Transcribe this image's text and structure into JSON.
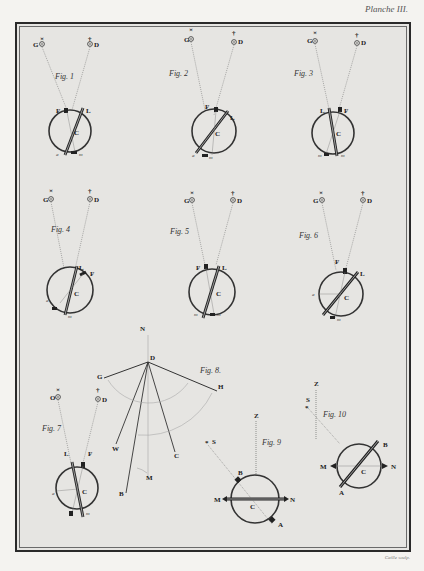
{
  "plate": {
    "title": "Planche III.",
    "engraver": "Caille sculp."
  },
  "figures": [
    {
      "id": "fig1",
      "label": "Fig. 1",
      "left_star": "G",
      "right_star": "D",
      "left_symbol": "×",
      "right_symbol": "†",
      "sight_left": "F",
      "sight_right": "L",
      "center": "C",
      "lower_left": "a",
      "lower_right": "m"
    },
    {
      "id": "fig2",
      "label": "Fig. 2",
      "left_star": "G",
      "right_star": "D",
      "left_symbol": "×",
      "right_symbol": "†",
      "sight_left": "F",
      "sight_right": "L",
      "center": "C",
      "lower_left": "a",
      "lower_right": "m"
    },
    {
      "id": "fig3",
      "label": "Fig. 3",
      "left_star": "G",
      "right_star": "D",
      "left_symbol": "×",
      "right_symbol": "†",
      "sight_left": "L",
      "sight_right": "F",
      "center": "C",
      "lower_left": "m",
      "lower_right": "m"
    },
    {
      "id": "fig4",
      "label": "Fig. 4",
      "left_star": "G",
      "right_star": "D",
      "left_symbol": "×",
      "right_symbol": "†",
      "sight_left": "L",
      "sight_right": "F",
      "center": "C",
      "lower_left": "a",
      "lower_right": "m"
    },
    {
      "id": "fig5",
      "label": "Fig. 5",
      "left_star": "G",
      "right_star": "D",
      "left_symbol": "×",
      "right_symbol": "†",
      "sight_left": "F",
      "sight_right": "L",
      "center": "C",
      "lower_left": "m",
      "lower_right": "m"
    },
    {
      "id": "fig6",
      "label": "Fig. 6",
      "left_star": "G",
      "right_star": "D",
      "left_symbol": "×",
      "right_symbol": "†",
      "sight_left": "F",
      "sight_right": "L",
      "center": "C",
      "lower_left": "a",
      "lower_right": "m"
    },
    {
      "id": "fig7",
      "label": "Fig. 7",
      "left_star": "O",
      "right_star": "D",
      "left_symbol": "×",
      "right_symbol": "†",
      "sight_left": "L",
      "sight_right": "F",
      "center": "C",
      "lower_left": "a",
      "lower_right": "m"
    },
    {
      "id": "fig8",
      "label": "Fig. 8.",
      "points": {
        "N": "N",
        "D": "D",
        "G": "G",
        "H": "H",
        "W": "W",
        "B": "B",
        "M": "M",
        "C": "C"
      }
    },
    {
      "id": "fig9",
      "label": "Fig. 9",
      "points": {
        "Z": "Z",
        "S": "S",
        "B": "B",
        "M": "M",
        "N": "N",
        "C": "C",
        "A": "A"
      }
    },
    {
      "id": "fig10",
      "label": "Fig. 10",
      "points": {
        "Z": "Z",
        "S": "S",
        "B": "B",
        "M": "M",
        "N": "N",
        "C": "C",
        "A": "A"
      }
    }
  ],
  "colors": {
    "paper": "#f4f3f0",
    "plate_bg": "#e6e5e2",
    "ink": "#2a2a2a",
    "arc": "#aaaaaa"
  }
}
